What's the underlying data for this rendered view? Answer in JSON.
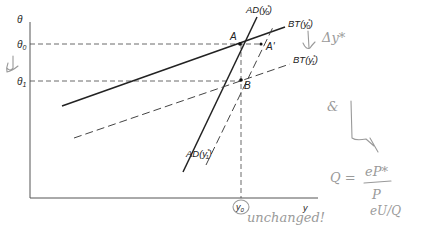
{
  "diagram": {
    "axes": {
      "y_axis_label": "θ",
      "x_axis_label": "y",
      "y_ticks": [
        {
          "label": "θ",
          "sub": "0",
          "y": 44
        },
        {
          "label": "θ",
          "sub": "1",
          "y": 81
        }
      ],
      "x_ticks": [
        {
          "label": "y",
          "sub": "0",
          "x": 241
        }
      ]
    },
    "curves": [
      {
        "id": "AD-y0",
        "label": "AD(y",
        "sub": "0",
        "sup": "*",
        "close": ")",
        "style": "solid"
      },
      {
        "id": "BT-y0",
        "label": "BT(y",
        "sub": "0",
        "sup": "*",
        "close": ")",
        "style": "solid"
      },
      {
        "id": "BT-y1",
        "label": "BT(y",
        "sub": "1",
        "sup": "*",
        "close": ")",
        "style": "dashed"
      },
      {
        "id": "AD-y1",
        "label": "AD(y",
        "sub": "1",
        "sup": "*",
        "close": ")",
        "style": "dashed"
      }
    ],
    "points": [
      {
        "label": "A",
        "x": 240,
        "y": 44
      },
      {
        "label": "A'",
        "x": 261,
        "y": 44
      },
      {
        "label": "B",
        "x": 241,
        "y": 80
      }
    ],
    "annotations": {
      "delta_y_star": "Δy*",
      "unchanged": "unchanged!",
      "formula_lhs": "Q =",
      "formula_num": "eP*",
      "formula_den": "P",
      "formula_extra": "eU/Q",
      "amp": "&"
    },
    "colors": {
      "ink": "#222222",
      "handwriting": "#9a9a9a"
    }
  }
}
